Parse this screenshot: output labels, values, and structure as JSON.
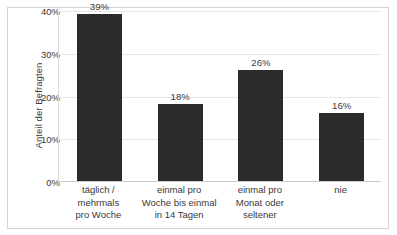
{
  "chart_data": {
    "type": "bar",
    "title": "",
    "xlabel": "",
    "ylabel": "Anteil der Befragten",
    "categories": [
      "täglich /\nmehrmals\npro Woche",
      "einmal pro\nWoche bis einmal\nin 14 Tagen",
      "einmal pro\nMonat oder\nseltener",
      "nie"
    ],
    "values": [
      39,
      18,
      26,
      16
    ],
    "value_labels": [
      "39%",
      "18%",
      "26%",
      "16%"
    ],
    "ylim": [
      0,
      40
    ],
    "yticks": [
      0,
      10,
      20,
      30,
      40
    ],
    "ytick_labels": [
      "0%",
      "10%",
      "20%",
      "30%",
      "40%"
    ],
    "grid": true,
    "legend": "none",
    "bar_color": "#2b2b2b",
    "grid_color": "#e6e6e6",
    "axis_color": "#d9d9d9",
    "text_color": "#3a3a3a",
    "background_color": "#ffffff",
    "frame_color": "#d4d4d4"
  }
}
